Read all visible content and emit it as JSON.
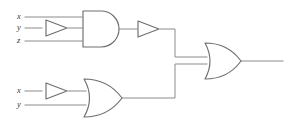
{
  "diagram": {
    "colors": {
      "wire": "#8b8b8b",
      "gate_outline": "#6e6e6e",
      "gate_fill": "#ffffff",
      "label_text": "#3a3a3a",
      "background": "#ffffff"
    },
    "inputs_top": [
      {
        "label": "x"
      },
      {
        "label": "y"
      },
      {
        "label": "z"
      }
    ],
    "inputs_bottom": [
      {
        "label": "x"
      },
      {
        "label": "y"
      }
    ],
    "gates": [
      {
        "name": "buffer-top-y",
        "type": "buffer"
      },
      {
        "name": "and-gate-top",
        "type": "and",
        "inputs": 3
      },
      {
        "name": "buffer-top-output",
        "type": "buffer"
      },
      {
        "name": "buffer-bottom-x",
        "type": "buffer"
      },
      {
        "name": "or-gate-bottom",
        "type": "or",
        "inputs": 2
      },
      {
        "name": "or-gate-final",
        "type": "or",
        "inputs": 2
      }
    ]
  }
}
